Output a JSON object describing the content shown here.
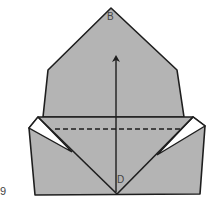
{
  "diagram": {
    "step_number": "9",
    "labels": {
      "top": "B",
      "bottom": "D"
    },
    "colors": {
      "paper": "#b4b4b4",
      "line": "#1e1e1e",
      "background": "#ffffff"
    }
  }
}
